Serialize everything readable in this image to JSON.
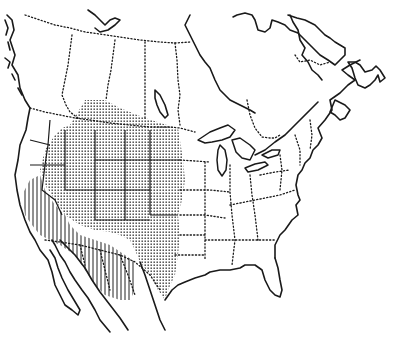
{
  "map": {
    "type": "species-range-map",
    "region": "North America",
    "style": "black-and-white line map",
    "colors": {
      "background": "#ffffff",
      "ink": "#1a1a1a"
    },
    "legend_visible": false,
    "range_areas": [
      {
        "name": "stippled-range",
        "pattern": "dots",
        "extent": "Great Plains, Rocky Mountain states, southern Canadian prairies, Texas"
      },
      {
        "name": "hatched-range",
        "pattern": "vertical-lines",
        "extent": "California, Nevada, Arizona, northern Mexico"
      }
    ]
  }
}
